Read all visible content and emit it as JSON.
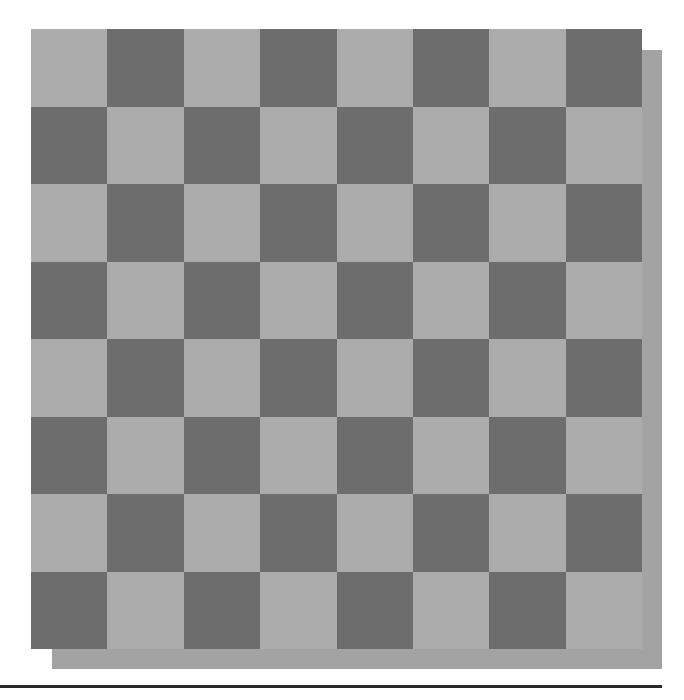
{
  "board": {
    "rows": 8,
    "cols": 8,
    "top_left_color": "light",
    "colors": {
      "light": "#acacac",
      "dark": "#6d6d6d",
      "shadow": "#a3a3a3",
      "rule": "#2a2a2a"
    },
    "pieces": []
  }
}
